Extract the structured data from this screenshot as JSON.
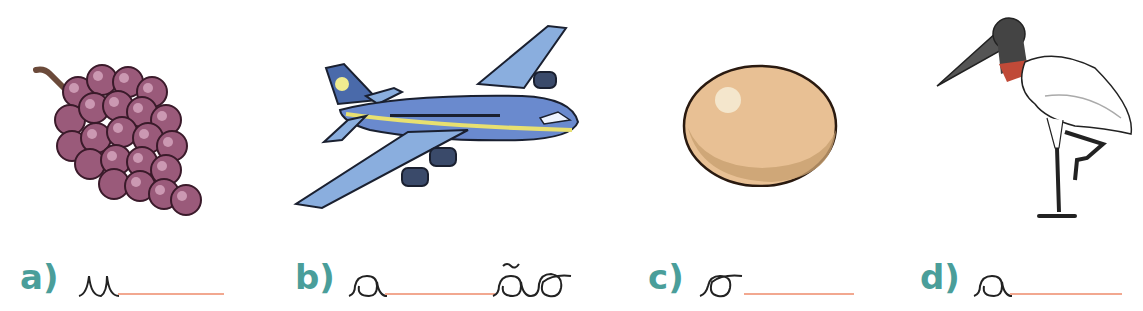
{
  "colors": {
    "label": "#4a9e9a",
    "answer_line": "#f2a890",
    "cursive_ink": "#222222"
  },
  "exercise": {
    "items": [
      {
        "label": "a)",
        "image": "grapes-icon",
        "prefix": "u",
        "suffix": "",
        "word_hint": "u____"
      },
      {
        "label": "b)",
        "image": "airplane-icon",
        "prefix": "a",
        "suffix": "ão",
        "word_hint": "a____ão"
      },
      {
        "label": "c)",
        "image": "egg-icon",
        "prefix": "o",
        "suffix": "",
        "word_hint": "o____"
      },
      {
        "label": "d)",
        "image": "jabiru-stork-icon",
        "prefix": "a",
        "suffix": "",
        "word_hint": "a____"
      }
    ]
  }
}
